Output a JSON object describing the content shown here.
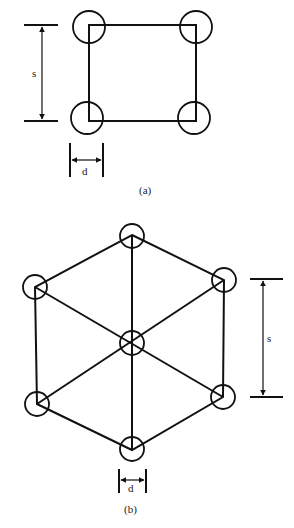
{
  "figure_a": {
    "caption": "(a)",
    "arrangement": "square",
    "spacing_label": "s",
    "diameter_label": "d",
    "circles": 4
  },
  "figure_b": {
    "caption": "(b)",
    "arrangement": "hexagonal",
    "spacing_label": "s",
    "diameter_label": "d",
    "circles": 7
  }
}
